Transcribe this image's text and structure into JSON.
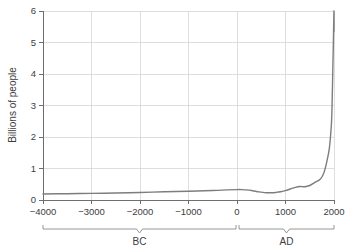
{
  "chart_data": {
    "type": "line",
    "title": "",
    "xlabel": "",
    "ylabel": "Billions of people",
    "xlim": [
      -4000,
      2000
    ],
    "ylim": [
      0,
      6
    ],
    "grid": true,
    "legend": "none",
    "x_ticks": [
      "-4000",
      "-3000",
      "-2000",
      "-1000",
      "0",
      "1000",
      "2000"
    ],
    "x_tick_values": [
      -4000,
      -3000,
      -2000,
      -1000,
      0,
      1000,
      2000
    ],
    "y_ticks": [
      "0",
      "1",
      "2",
      "3",
      "4",
      "5",
      "6"
    ],
    "y_tick_values": [
      0,
      1,
      2,
      3,
      4,
      5,
      6
    ],
    "series": [
      {
        "name": "World population",
        "color": "#7d7d7d",
        "x": [
          -4000,
          -3500,
          -3000,
          -2500,
          -2000,
          -1500,
          -1000,
          -500,
          -200,
          0,
          100,
          200,
          300,
          400,
          500,
          600,
          700,
          800,
          900,
          1000,
          1100,
          1200,
          1300,
          1400,
          1500,
          1600,
          1700,
          1750,
          1800,
          1850,
          1900,
          1927,
          1950,
          1960,
          1974,
          1987,
          1999,
          2000
        ],
        "y": [
          0.19,
          0.2,
          0.21,
          0.22,
          0.24,
          0.26,
          0.28,
          0.3,
          0.32,
          0.33,
          0.33,
          0.32,
          0.3,
          0.27,
          0.25,
          0.23,
          0.23,
          0.24,
          0.26,
          0.3,
          0.35,
          0.4,
          0.43,
          0.42,
          0.46,
          0.55,
          0.64,
          0.73,
          0.9,
          1.2,
          1.6,
          2.0,
          2.5,
          3.0,
          4.0,
          5.0,
          6.0,
          5.35
        ]
      }
    ],
    "annotations": [
      {
        "id": "brace-bc",
        "label": "BC",
        "from": -4000,
        "to": 0
      },
      {
        "id": "brace-ad",
        "label": "AD",
        "from": 0,
        "to": 2000
      }
    ]
  },
  "axes": {
    "y_title": "Billions of people"
  },
  "braces": {
    "bc_label": "BC",
    "ad_label": "AD"
  },
  "colors": {
    "curve": "#7d7d7d",
    "grid": "#d0d0d0",
    "axis": "#6e6e6e",
    "text": "#3d3d3d",
    "background": "#ffffff"
  }
}
